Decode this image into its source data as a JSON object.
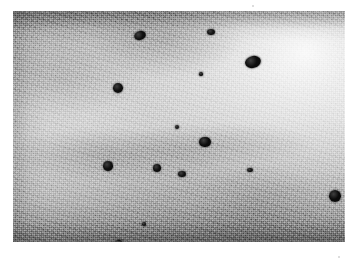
{
  "page": {
    "kind": "scanned-micrograph-figure",
    "background_color": "#ffffff",
    "width": 356,
    "height": 266,
    "caption": "",
    "label": ""
  },
  "micrograph": {
    "name": "electron-micrograph",
    "modality": "transmission electron micrograph",
    "colorspace": "grayscale",
    "frame": {
      "x": 13,
      "y": 11,
      "width": 332,
      "height": 231
    },
    "background_description": "grainy mottled grey emulsion field, bright diffuse lobe toward the upper-right corner, darker horizontal bands along the top and bottom edges and along the left edge",
    "tone": {
      "darkest_hex": "#8a8a8a",
      "midtone_hex": "#b9b9b9",
      "brightest_hex": "#f2f2f2",
      "particle_hex": "#0f0f0f"
    },
    "grain": {
      "description": "fine random emulsion speckle with coarser clumping",
      "visible": true
    },
    "particles": [
      {
        "id": 1,
        "cx": 127,
        "cy": 24,
        "rx": 6.0,
        "ry": 4.5,
        "rot": -18,
        "tone": "#101010"
      },
      {
        "id": 2,
        "cx": 198,
        "cy": 21,
        "rx": 4.0,
        "ry": 3.2,
        "rot": 0,
        "tone": "#141414"
      },
      {
        "id": 3,
        "cx": 240,
        "cy": 51,
        "rx": 8.0,
        "ry": 6.0,
        "rot": -14,
        "tone": "#0c0c0c"
      },
      {
        "id": 4,
        "cx": 105,
        "cy": 77,
        "rx": 5.2,
        "ry": 5.0,
        "rot": 0,
        "tone": "#101010"
      },
      {
        "id": 5,
        "cx": 188,
        "cy": 63,
        "rx": 1.6,
        "ry": 1.6,
        "rot": 0,
        "tone": "#1a1a1a"
      },
      {
        "id": 6,
        "cx": 164,
        "cy": 116,
        "rx": 2.3,
        "ry": 2.3,
        "rot": 0,
        "tone": "#151515"
      },
      {
        "id": 7,
        "cx": 192,
        "cy": 131,
        "rx": 5.6,
        "ry": 5.4,
        "rot": 0,
        "tone": "#0d0d0d"
      },
      {
        "id": 8,
        "cx": 95,
        "cy": 155,
        "rx": 5.0,
        "ry": 4.6,
        "rot": 0,
        "tone": "#101010"
      },
      {
        "id": 9,
        "cx": 144,
        "cy": 157,
        "rx": 4.2,
        "ry": 4.0,
        "rot": 0,
        "tone": "#111111"
      },
      {
        "id": 10,
        "cx": 169,
        "cy": 163,
        "rx": 3.6,
        "ry": 3.2,
        "rot": 0,
        "tone": "#131313"
      },
      {
        "id": 11,
        "cx": 237,
        "cy": 159,
        "rx": 2.6,
        "ry": 2.4,
        "rot": 0,
        "tone": "#161616"
      },
      {
        "id": 12,
        "cx": 322,
        "cy": 185,
        "rx": 6.2,
        "ry": 6.0,
        "rot": 0,
        "tone": "#0b0b0b"
      },
      {
        "id": 13,
        "cx": 131,
        "cy": 213,
        "rx": 1.8,
        "ry": 1.8,
        "rot": 0,
        "tone": "#191919"
      },
      {
        "id": 14,
        "cx": 105,
        "cy": 233,
        "rx": 4.4,
        "ry": 4.0,
        "rot": -20,
        "tone": "#0f0f0f"
      }
    ],
    "particle_count": 14
  },
  "margin_specks": [
    {
      "x": 252,
      "y": 5,
      "size": 2
    },
    {
      "x": 338,
      "y": 256,
      "size": 2
    }
  ]
}
